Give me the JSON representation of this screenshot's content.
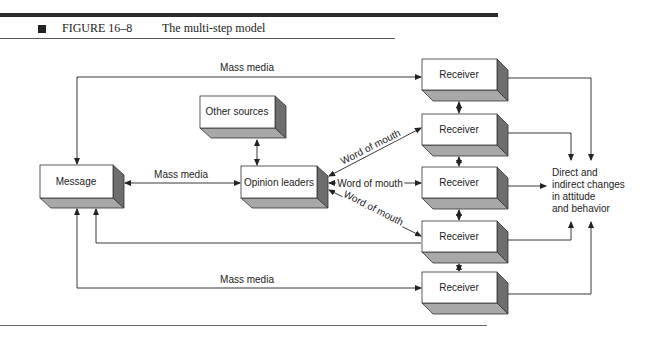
{
  "figure": {
    "number": "FIGURE 16–8",
    "title": "The multi-step model"
  },
  "nodes": {
    "message": "Message",
    "other_sources": "Other sources",
    "opinion_leaders": "Opinion leaders",
    "receivers": [
      "Receiver",
      "Receiver",
      "Receiver",
      "Receiver",
      "Receiver"
    ],
    "outcome": "Direct and\nindirect changes\nin attitude\nand behavior"
  },
  "edges": {
    "mass_media_top": "Mass media",
    "mass_media_middle": "Mass media",
    "mass_media_bottom": "Mass media",
    "word_of_mouth_upper": "Word of mouth",
    "word_of_mouth_middle": "Word of mouth",
    "word_of_mouth_lower": "Word of mouth"
  },
  "colors": {
    "box_face": "#ffffff",
    "box_side": "#6e6e6e",
    "box_bottom": "#a8a8a8",
    "line": "#222222"
  }
}
